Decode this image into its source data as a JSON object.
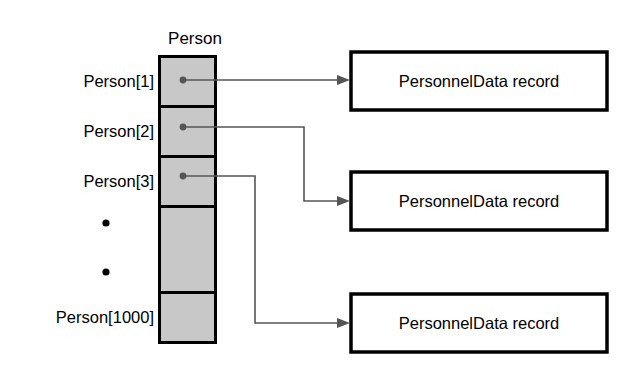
{
  "diagram": {
    "title": "Person",
    "array": {
      "name": "Person",
      "cell_labels": [
        "Person[1]",
        "Person[2]",
        "Person[3]",
        "Person[1000]"
      ],
      "ellipsis": [
        "•",
        "•"
      ],
      "fill_color": "#c8c8c8",
      "border_color": "#000000"
    },
    "records": [
      {
        "label": "PersonnelData record"
      },
      {
        "label": "PersonnelData record"
      },
      {
        "label": "PersonnelData record"
      }
    ],
    "pointer_color": "#555555",
    "background_color": "#ffffff"
  }
}
